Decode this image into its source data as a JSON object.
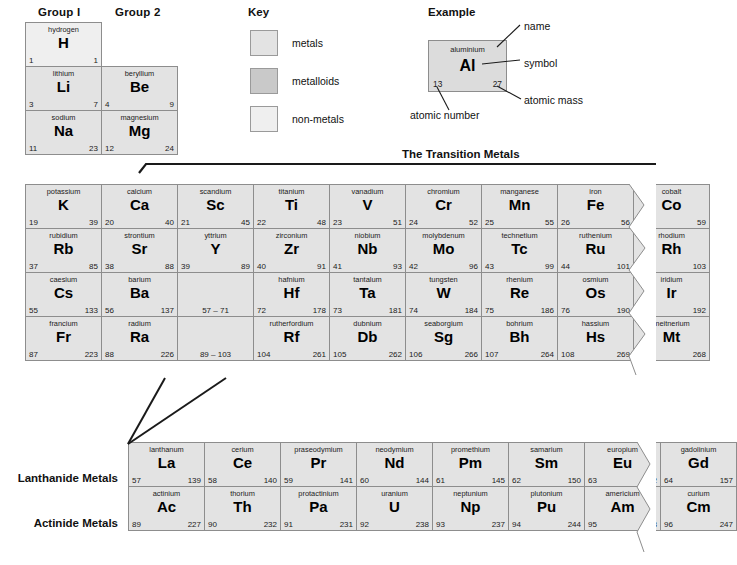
{
  "headers": {
    "group1": "Group I",
    "group2": "Group 2",
    "key_title": "Key",
    "example_title": "Example",
    "transition_title": "The Transition Metals",
    "lanthanide_label": "Lanthanide Metals",
    "actinide_label": "Actinide Metals"
  },
  "key": {
    "items": [
      {
        "label": "metals",
        "color": "#e3e3e3",
        "swatch": "metals-swatch"
      },
      {
        "label": "metalloids",
        "color": "#c9c9c9",
        "swatch": "metalloids-swatch"
      },
      {
        "label": "non-metals",
        "color": "#efefef",
        "swatch": "non-metals-swatch"
      }
    ]
  },
  "example": {
    "name": "aluminium",
    "symbol": "Al",
    "number": "13",
    "mass": "27",
    "annotations": {
      "name": "name",
      "symbol": "symbol",
      "mass": "atomic mass",
      "number": "atomic number"
    }
  },
  "chart_data": {
    "type": "table",
    "columns": [
      "name",
      "symbol",
      "atomic_number",
      "atomic_mass"
    ],
    "main_rows": [
      [
        {
          "name": "hydrogen",
          "symbol": "H",
          "number": "1",
          "mass": "1",
          "cls": "nonmetal"
        }
      ],
      [
        {
          "name": "lithium",
          "symbol": "Li",
          "number": "3",
          "mass": "7",
          "cls": ""
        },
        {
          "name": "beryllium",
          "symbol": "Be",
          "number": "4",
          "mass": "9",
          "cls": ""
        }
      ],
      [
        {
          "name": "sodium",
          "symbol": "Na",
          "number": "11",
          "mass": "23",
          "cls": ""
        },
        {
          "name": "magnesium",
          "symbol": "Mg",
          "number": "12",
          "mass": "24",
          "cls": ""
        }
      ]
    ],
    "transition_rows": [
      [
        {
          "name": "potassium",
          "symbol": "K",
          "number": "19",
          "mass": "39",
          "cls": ""
        },
        {
          "name": "calcium",
          "symbol": "Ca",
          "number": "20",
          "mass": "40",
          "cls": ""
        },
        {
          "name": "scandium",
          "symbol": "Sc",
          "number": "21",
          "mass": "45",
          "cls": ""
        },
        {
          "name": "titanium",
          "symbol": "Ti",
          "number": "22",
          "mass": "48",
          "cls": ""
        },
        {
          "name": "vanadium",
          "symbol": "V",
          "number": "23",
          "mass": "51",
          "cls": ""
        },
        {
          "name": "chromium",
          "symbol": "Cr",
          "number": "24",
          "mass": "52",
          "cls": ""
        },
        {
          "name": "manganese",
          "symbol": "Mn",
          "number": "25",
          "mass": "55",
          "cls": ""
        },
        {
          "name": "iron",
          "symbol": "Fe",
          "number": "26",
          "mass": "56",
          "cls": ""
        },
        {
          "name": "cobalt",
          "symbol": "Co",
          "number": "27",
          "mass": "59",
          "cls": ""
        }
      ],
      [
        {
          "name": "rubidium",
          "symbol": "Rb",
          "number": "37",
          "mass": "85",
          "cls": ""
        },
        {
          "name": "strontium",
          "symbol": "Sr",
          "number": "38",
          "mass": "88",
          "cls": ""
        },
        {
          "name": "yttrium",
          "symbol": "Y",
          "number": "39",
          "mass": "89",
          "cls": ""
        },
        {
          "name": "zirconium",
          "symbol": "Zr",
          "number": "40",
          "mass": "91",
          "cls": ""
        },
        {
          "name": "niobium",
          "symbol": "Nb",
          "number": "41",
          "mass": "93",
          "cls": ""
        },
        {
          "name": "molybdenum",
          "symbol": "Mo",
          "number": "42",
          "mass": "96",
          "cls": ""
        },
        {
          "name": "technetium",
          "symbol": "Tc",
          "number": "43",
          "mass": "99",
          "cls": ""
        },
        {
          "name": "ruthenium",
          "symbol": "Ru",
          "number": "44",
          "mass": "101",
          "cls": ""
        },
        {
          "name": "rhodium",
          "symbol": "Rh",
          "number": "45",
          "mass": "103",
          "cls": ""
        }
      ],
      [
        {
          "name": "caesium",
          "symbol": "Cs",
          "number": "55",
          "mass": "133",
          "cls": ""
        },
        {
          "name": "barium",
          "symbol": "Ba",
          "number": "56",
          "mass": "137",
          "cls": ""
        },
        {
          "name": "",
          "symbol": "",
          "number": "",
          "mass": "",
          "range": "57 – 71",
          "cls": ""
        },
        {
          "name": "hafnium",
          "symbol": "Hf",
          "number": "72",
          "mass": "178",
          "cls": ""
        },
        {
          "name": "tantalum",
          "symbol": "Ta",
          "number": "73",
          "mass": "181",
          "cls": ""
        },
        {
          "name": "tungsten",
          "symbol": "W",
          "number": "74",
          "mass": "184",
          "cls": ""
        },
        {
          "name": "rhenium",
          "symbol": "Re",
          "number": "75",
          "mass": "186",
          "cls": ""
        },
        {
          "name": "osmium",
          "symbol": "Os",
          "number": "76",
          "mass": "190",
          "cls": ""
        },
        {
          "name": "iridium",
          "symbol": "Ir",
          "number": "77",
          "mass": "192",
          "cls": ""
        }
      ],
      [
        {
          "name": "francium",
          "symbol": "Fr",
          "number": "87",
          "mass": "223",
          "cls": ""
        },
        {
          "name": "radium",
          "symbol": "Ra",
          "number": "88",
          "mass": "226",
          "cls": ""
        },
        {
          "name": "",
          "symbol": "",
          "number": "",
          "mass": "",
          "range": "89 – 103",
          "cls": ""
        },
        {
          "name": "rutherfordium",
          "symbol": "Rf",
          "number": "104",
          "mass": "261",
          "cls": ""
        },
        {
          "name": "dubnium",
          "symbol": "Db",
          "number": "105",
          "mass": "262",
          "cls": ""
        },
        {
          "name": "seaborgium",
          "symbol": "Sg",
          "number": "106",
          "mass": "266",
          "cls": ""
        },
        {
          "name": "bohrium",
          "symbol": "Bh",
          "number": "107",
          "mass": "264",
          "cls": ""
        },
        {
          "name": "hassium",
          "symbol": "Hs",
          "number": "108",
          "mass": "269",
          "cls": ""
        },
        {
          "name": "meitnerium",
          "symbol": "Mt",
          "number": "109",
          "mass": "268",
          "cls": ""
        }
      ]
    ],
    "lanthanides": [
      {
        "name": "lanthanum",
        "symbol": "La",
        "number": "57",
        "mass": "139",
        "cls": ""
      },
      {
        "name": "cerium",
        "symbol": "Ce",
        "number": "58",
        "mass": "140",
        "cls": ""
      },
      {
        "name": "praseodymium",
        "symbol": "Pr",
        "number": "59",
        "mass": "141",
        "cls": ""
      },
      {
        "name": "neodymium",
        "symbol": "Nd",
        "number": "60",
        "mass": "144",
        "cls": ""
      },
      {
        "name": "promethium",
        "symbol": "Pm",
        "number": "61",
        "mass": "145",
        "cls": ""
      },
      {
        "name": "samarium",
        "symbol": "Sm",
        "number": "62",
        "mass": "150",
        "cls": ""
      },
      {
        "name": "europium",
        "symbol": "Eu",
        "number": "63",
        "mass": "152",
        "cls": ""
      },
      {
        "name": "gadolinium",
        "symbol": "Gd",
        "number": "64",
        "mass": "157",
        "cls": ""
      }
    ],
    "actinides": [
      {
        "name": "actinium",
        "symbol": "Ac",
        "number": "89",
        "mass": "227",
        "cls": ""
      },
      {
        "name": "thorium",
        "symbol": "Th",
        "number": "90",
        "mass": "232",
        "cls": ""
      },
      {
        "name": "protactinium",
        "symbol": "Pa",
        "number": "91",
        "mass": "231",
        "cls": ""
      },
      {
        "name": "uranium",
        "symbol": "U",
        "number": "92",
        "mass": "238",
        "cls": ""
      },
      {
        "name": "neptunium",
        "symbol": "Np",
        "number": "93",
        "mass": "237",
        "cls": ""
      },
      {
        "name": "plutonium",
        "symbol": "Pu",
        "number": "94",
        "mass": "244",
        "cls": ""
      },
      {
        "name": "americium",
        "symbol": "Am",
        "number": "95",
        "mass": "243",
        "cls": ""
      },
      {
        "name": "curium",
        "symbol": "Cm",
        "number": "96",
        "mass": "247",
        "cls": ""
      }
    ]
  },
  "layout": {
    "cell_w": 77,
    "cell_h": 45,
    "main_left": 25,
    "main_top": 22,
    "trans_top": 184,
    "lan_left": 128,
    "lan_top": 442
  }
}
